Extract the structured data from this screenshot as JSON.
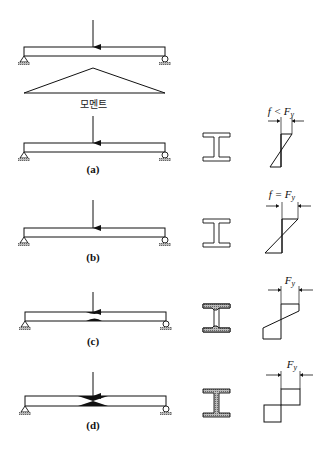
{
  "diagram": {
    "moment_label": "모멘트",
    "cases": [
      {
        "id": "a",
        "label": "(a)",
        "stress_label": "f < F",
        "stress_sub": "y",
        "section_state": "elastic",
        "stress_state": "linear-below-yield"
      },
      {
        "id": "b",
        "label": "(b)",
        "stress_label": "f = F",
        "stress_sub": "y",
        "section_state": "elastic",
        "stress_state": "first-yield"
      },
      {
        "id": "c",
        "label": "(c)",
        "stress_label": "F",
        "stress_sub": "y",
        "section_state": "partially-plastic",
        "stress_state": "partial-plastic"
      },
      {
        "id": "d",
        "label": "(d)",
        "stress_label": "F",
        "stress_sub": "y",
        "section_state": "fully-plastic",
        "stress_state": "plastic-hinge"
      }
    ],
    "colors": {
      "line": "#111111",
      "hatch": "#8a8a8a",
      "background": "#ffffff"
    }
  }
}
